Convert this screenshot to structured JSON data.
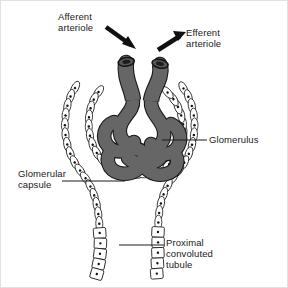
{
  "figure": {
    "background_color": "#ffffff",
    "capillary_fill": "#666666",
    "outline_color": "#1a1a1a",
    "arrow_color": "#111111",
    "text_color": "#1a1a1a",
    "border_color": "#d8d8d8"
  },
  "labels": {
    "afferent_arteriole": "Afferent\narteriole",
    "efferent_arteriole": "Efferent\narteriole",
    "glomerulus": "Glomerulus",
    "glomerular_capsule": "Glomerular\ncapsule",
    "proximal_convoluted_tubule": "Proximal\nconvoluted\ntubule"
  },
  "structures": {
    "afferent_arteriole": "afferent-arteriole-vessel",
    "efferent_arteriole": "efferent-arteriole-vessel",
    "glomerulus": "glomerular-capillary-tuft",
    "capsule_parietal_layer": "bowmans-capsule-parietal-layer",
    "capsule_visceral_layer": "bowmans-capsule-visceral-layer",
    "proximal_convoluted_tubule": "proximal-convoluted-tubule-wall"
  },
  "arrows": {
    "afferent_inflow": "arrow-pointing-down-right-into-afferent-arteriole",
    "efferent_outflow": "arrow-pointing-up-right-out-of-efferent-arteriole"
  },
  "leader_lines": {
    "glomerulus": "leader-line-horizontal-left-from-glomerulus-label",
    "glomerular_capsule": "leader-line-horizontal-right-from-capsule-label",
    "proximal_convoluted_tubule": "leader-line-horizontal-left-from-tubule-label"
  }
}
